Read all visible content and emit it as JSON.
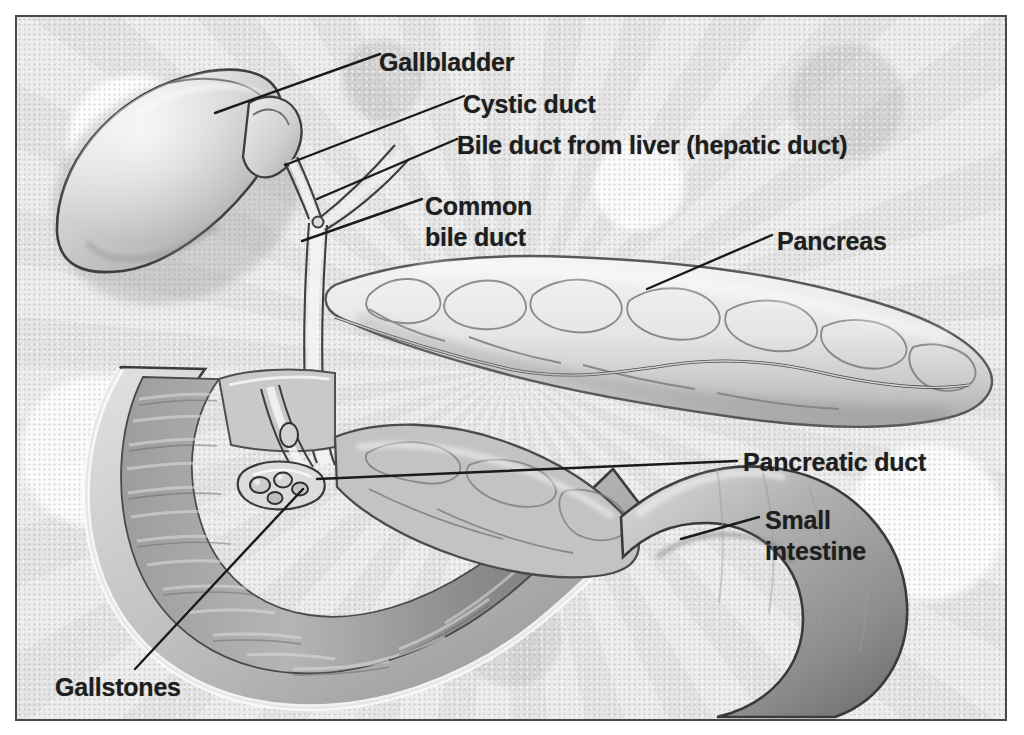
{
  "figure": {
    "kind": "medical-illustration",
    "style": "grayscale pencil/airbrush anatomical drawing on mottled gray paper, thin dark rectangular frame",
    "background_color": "#e9e9e9",
    "frame_color": "#4a4a4a",
    "label_color": "#1e1e1e",
    "leader_color": "#1a1a1a"
  },
  "labels": {
    "gallbladder": "Gallbladder",
    "cystic_duct": "Cystic duct",
    "hepatic_duct": "Bile duct from liver (hepatic duct)",
    "common_bile_duct_line1": "Common",
    "common_bile_duct_line2": "bile duct",
    "pancreas": "Pancreas",
    "pancreatic_duct": "Pancreatic duct",
    "small_intestine_line1": "Small",
    "small_intestine_line2": "intestine",
    "gallstones": "Gallstones"
  },
  "structures": [
    {
      "name": "gallbladder",
      "label": "Gallbladder",
      "description": "large pear-shaped sac, upper left, tilted down-left"
    },
    {
      "name": "cystic-duct",
      "label": "Cystic duct",
      "description": "short duct from gallbladder neck joining the hepatic duct"
    },
    {
      "name": "hepatic-duct",
      "label": "Bile duct from liver (hepatic duct)",
      "description": "duct descending from upper right, forms Y junction with cystic duct"
    },
    {
      "name": "common-bile-duct",
      "label": "Common bile duct",
      "description": "vertical duct below the Y junction running down behind the duodenum to the ampulla"
    },
    {
      "name": "pancreas",
      "label": "Pancreas",
      "description": "elongated lobulated gland extending right across the image"
    },
    {
      "name": "pancreatic-duct",
      "label": "Pancreatic duct",
      "description": "wavy duct running the length of the pancreas to the ampulla"
    },
    {
      "name": "small-intestine",
      "label": "Small intestine",
      "description": "duodenal C-loop, cut open on the left to show mucosal folds, continuing lower right"
    },
    {
      "name": "gallstones",
      "label": "Gallstones",
      "description": "small rounded stones lodged at the duct junction / ampulla"
    }
  ]
}
